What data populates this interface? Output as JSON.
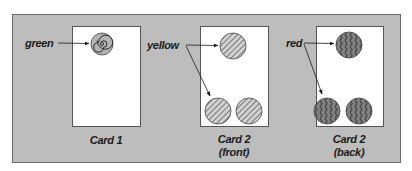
{
  "diagram": {
    "colors": {
      "panel_fill": "#bdbdbd",
      "panel_border": "#6a6a6a",
      "card_fill": "#ffffff",
      "card_border": "#555555",
      "ink": "#1a1a1a",
      "spiral_fill": "#b0b0b0",
      "hatch_fill": "#c8c8c8",
      "wave_fill": "#6e6e6e"
    },
    "labels": {
      "green": "green",
      "yellow": "yellow",
      "red": "red"
    },
    "cards": [
      {
        "id": "card1",
        "caption_line1": "Card 1",
        "caption_line2": "",
        "pattern": "spiral",
        "color_label": "green",
        "symbol_count": 1
      },
      {
        "id": "card2-front",
        "caption_line1": "Card 2",
        "caption_line2": "(front)",
        "pattern": "diagonal-hatch",
        "color_label": "yellow",
        "symbol_count": 3
      },
      {
        "id": "card2-back",
        "caption_line1": "Card 2",
        "caption_line2": "(back)",
        "pattern": "wavy",
        "color_label": "red",
        "symbol_count": 3
      }
    ]
  }
}
